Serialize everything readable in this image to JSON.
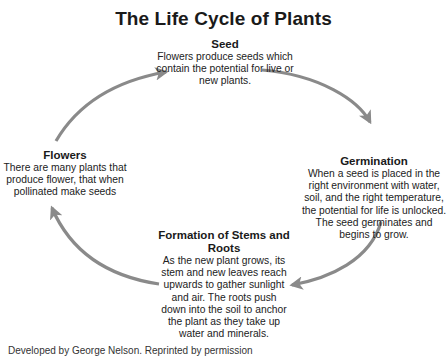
{
  "title": "The Life Cycle of Plants",
  "stages": [
    {
      "id": "seed",
      "heading": "Seed",
      "description": "Flowers produce seeds which contain the potential for live or new plants."
    },
    {
      "id": "germination",
      "heading": "Germination",
      "description": "When a seed is placed in the right environment with water, soil, and the right temperature, the potential for life is unlocked. The seed germinates and begins to grow."
    },
    {
      "id": "stems",
      "heading": "Formation of Stems and Roots",
      "description": "As the new plant grows, its stem and new leaves reach upwards to gather sunlight and air. The roots push down into the soil to anchor the plant as they take up water and minerals."
    },
    {
      "id": "flowers",
      "heading": "Flowers",
      "description": "There are many plants that produce flower, that when pollinated make seeds"
    }
  ],
  "arrows": {
    "color": "#8a8a8a",
    "flow": [
      "Seed → Germination",
      "Germination → Formation of Stems and Roots",
      "Formation of Stems and Roots → Flowers",
      "Flowers → Seed"
    ]
  },
  "credit": "Developed by George Nelson. Reprinted by permission"
}
